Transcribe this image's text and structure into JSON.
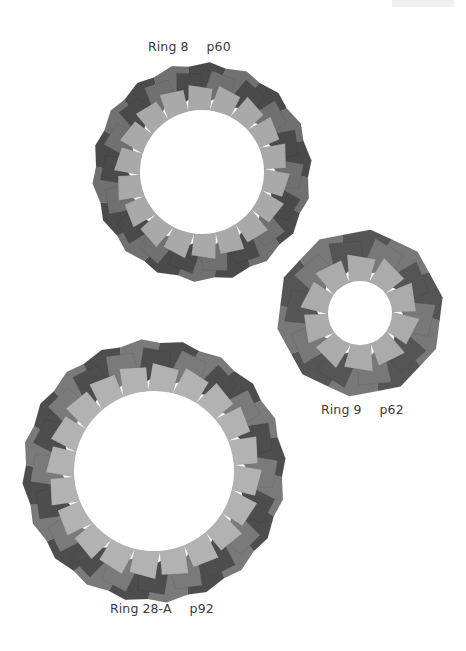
{
  "page": {
    "header_mark": ""
  },
  "rings": [
    {
      "name": "Ring 8",
      "page": "p60",
      "modules": 18,
      "colors": {
        "dark": "#4a4a4a",
        "mid": "#707070",
        "light": "#a9a9a9"
      }
    },
    {
      "name": "Ring 9",
      "page": "p62",
      "modules": 10,
      "colors": {
        "dark": "#555555",
        "mid": "#787878",
        "light": "#ababab"
      }
    },
    {
      "name": "Ring 28-A",
      "page": "p92",
      "modules": 20,
      "colors": {
        "dark": "#4d4d4d",
        "mid": "#7a7a7a",
        "light": "#b2b2b2"
      }
    }
  ]
}
